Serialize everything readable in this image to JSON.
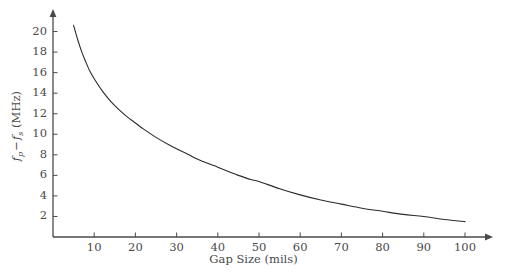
{
  "chart_data": {
    "type": "line",
    "title": "",
    "xlabel": "Gap Size (mils)",
    "ylabel_plain": "fp - fs (MHz)",
    "ylabel_parts": {
      "var1": "f",
      "sub1": "p",
      "minus": "−",
      "var2": "f",
      "sub2": "s",
      "units": "(MHz)"
    },
    "xlim": [
      0,
      106
    ],
    "ylim": [
      0,
      22
    ],
    "xticks": [
      10,
      20,
      30,
      40,
      50,
      60,
      70,
      80,
      90,
      100
    ],
    "xtick_labels": [
      "10",
      "20",
      "30",
      "40",
      "50",
      "60",
      "70",
      "80",
      "90",
      "100"
    ],
    "yticks": [
      2,
      4,
      6,
      8,
      10,
      12,
      14,
      16,
      18,
      20
    ],
    "ytick_labels": [
      "2",
      "4",
      "6",
      "8",
      "10",
      "12",
      "14",
      "16",
      "18",
      "20"
    ],
    "grid": false,
    "legend": null,
    "axis_arrows": true,
    "line_color": "#2b2b2b",
    "line_width": 1.1,
    "background_color": "#ffffff",
    "axis_color": "#4a4a4a",
    "x": [
      5,
      6,
      7,
      8,
      9,
      10,
      12,
      14,
      16,
      18,
      20,
      22,
      25,
      28,
      30,
      33,
      35,
      38,
      40,
      43,
      45,
      48,
      50,
      55,
      60,
      65,
      70,
      75,
      80,
      85,
      90,
      95,
      100
    ],
    "y": [
      20.6,
      19.2,
      18.0,
      17.0,
      16.1,
      15.4,
      14.2,
      13.2,
      12.4,
      11.7,
      11.1,
      10.5,
      9.7,
      9.0,
      8.6,
      8.0,
      7.6,
      7.1,
      6.8,
      6.3,
      6.0,
      5.6,
      5.4,
      4.7,
      4.1,
      3.6,
      3.2,
      2.8,
      2.5,
      2.2,
      2.0,
      1.7,
      1.5
    ]
  },
  "geometry": {
    "plot_left": 53,
    "plot_right": 465,
    "plot_bottom": 237,
    "plot_top": 11,
    "x_value_at_left": 0,
    "x_value_at_right": 100,
    "y_value_at_bottom": 0,
    "y_value_at_top": 22
  }
}
